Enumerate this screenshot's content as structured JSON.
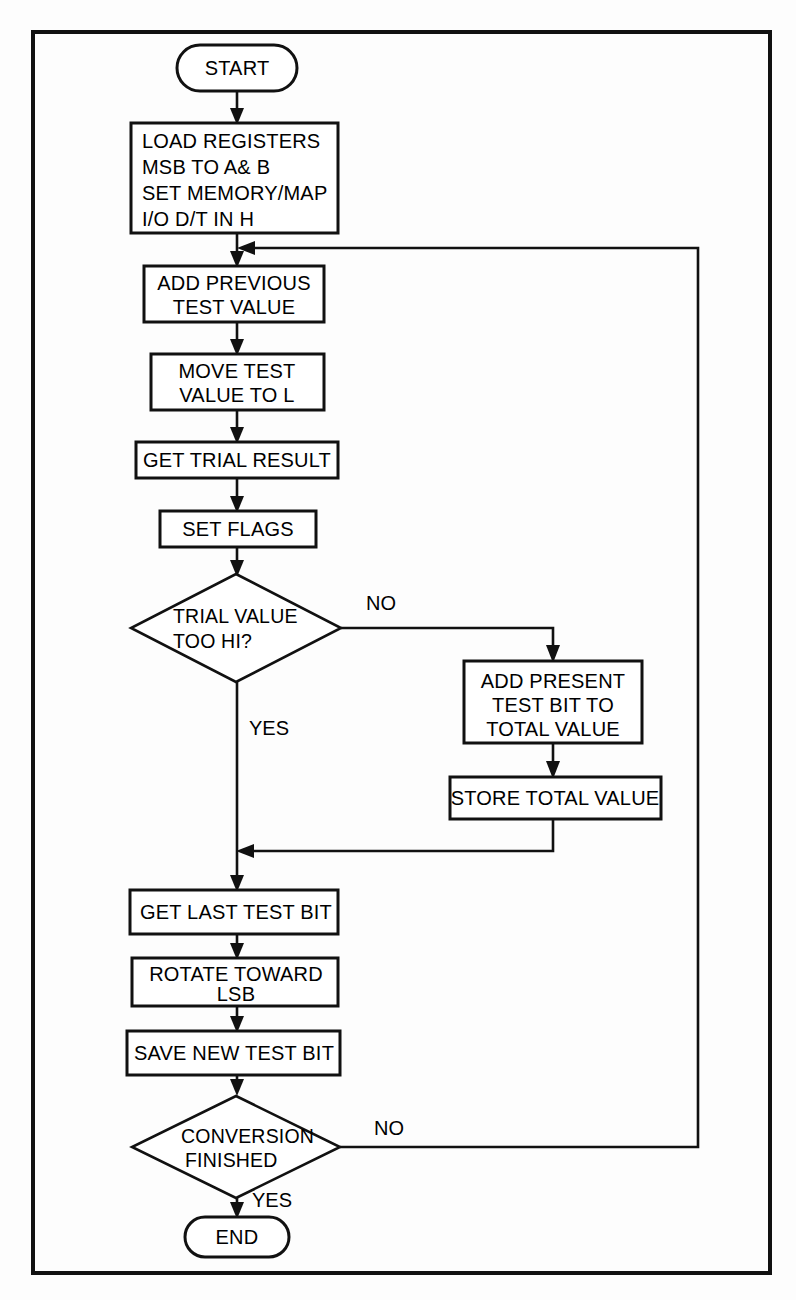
{
  "diagram": {
    "stroke_color": "#111111",
    "fill_color": "#ffffff",
    "background_color": "#fdfdfd",
    "frame": {
      "x": 33,
      "y": 32,
      "width": 737,
      "height": 1241
    },
    "nodes": [
      {
        "id": "start",
        "type": "terminator",
        "lines": [
          "START"
        ],
        "cx": 237,
        "cy": 68,
        "width": 120,
        "height": 46
      },
      {
        "id": "load_registers",
        "type": "process",
        "lines": [
          "LOAD REGISTERS",
          "MSB TO A& B",
          "SET MEMORY/MAP",
          "I/O D/T IN H"
        ],
        "x": 131,
        "y": 123,
        "width": 207,
        "height": 110
      },
      {
        "id": "add_previous",
        "type": "process",
        "lines": [
          "ADD PREVIOUS",
          "TEST VALUE"
        ],
        "x": 144,
        "y": 266,
        "width": 180,
        "height": 56
      },
      {
        "id": "move_test",
        "type": "process",
        "lines": [
          "MOVE TEST",
          "VALUE TO L"
        ],
        "x": 151,
        "y": 354,
        "width": 173,
        "height": 56
      },
      {
        "id": "get_trial_result",
        "type": "process",
        "lines": [
          "GET TRIAL RESULT"
        ],
        "x": 136,
        "y": 442,
        "width": 202,
        "height": 36
      },
      {
        "id": "set_flags",
        "type": "process",
        "lines": [
          "SET FLAGS"
        ],
        "x": 160,
        "y": 511,
        "width": 156,
        "height": 36
      },
      {
        "id": "trial_too_hi",
        "type": "decision",
        "lines": [
          "TRIAL VALUE",
          "TOO HI?"
        ],
        "cx": 236,
        "cy": 628,
        "halfw": 105,
        "halfh": 54
      },
      {
        "id": "add_present",
        "type": "process",
        "lines": [
          "ADD PRESENT",
          "TEST BIT TO",
          "TOTAL VALUE"
        ],
        "x": 464,
        "y": 661,
        "width": 178,
        "height": 82
      },
      {
        "id": "store_total",
        "type": "process",
        "lines": [
          "STORE TOTAL VALUE"
        ],
        "x": 450,
        "y": 777,
        "width": 211,
        "height": 42
      },
      {
        "id": "get_last_test_bit",
        "type": "process",
        "lines": [
          "GET LAST TEST BIT"
        ],
        "x": 130,
        "y": 890,
        "width": 208,
        "height": 44
      },
      {
        "id": "rotate_toward_lsb",
        "type": "process",
        "lines": [
          "ROTATE TOWARD",
          "LSB"
        ],
        "x": 132,
        "y": 958,
        "width": 206,
        "height": 48
      },
      {
        "id": "save_new_test_bit",
        "type": "process",
        "lines": [
          "SAVE NEW TEST BIT"
        ],
        "x": 127,
        "y": 1031,
        "width": 213,
        "height": 44
      },
      {
        "id": "conversion_finished",
        "type": "decision",
        "lines": [
          "CONVERSION",
          "FINISHED"
        ],
        "cx": 236,
        "cy": 1147,
        "halfw": 104,
        "halfh": 51
      },
      {
        "id": "end",
        "type": "terminator",
        "lines": [
          "END"
        ],
        "cx": 237,
        "cy": 1237,
        "width": 104,
        "height": 40
      }
    ],
    "edge_labels": [
      {
        "id": "no_trial",
        "text": "NO",
        "x": 366,
        "y": 610
      },
      {
        "id": "yes_trial",
        "text": "YES",
        "x": 249,
        "y": 735
      },
      {
        "id": "no_conversion",
        "text": "NO",
        "x": 374,
        "y": 1135
      },
      {
        "id": "yes_conversion",
        "text": "YES",
        "x": 252,
        "y": 1207
      }
    ],
    "connections": [
      {
        "id": "start-to-load",
        "from": "start",
        "to": "load_registers"
      },
      {
        "id": "load-to-add-previous",
        "from": "load_registers",
        "to": "add_previous"
      },
      {
        "id": "add-previous-to-move",
        "from": "add_previous",
        "to": "move_test"
      },
      {
        "id": "move-to-get-trial",
        "from": "move_test",
        "to": "get_trial_result"
      },
      {
        "id": "get-trial-to-set-flags",
        "from": "get_trial_result",
        "to": "set_flags"
      },
      {
        "id": "set-flags-to-decision",
        "from": "set_flags",
        "to": "trial_too_hi"
      },
      {
        "id": "trial-no-to-add-present",
        "from": "trial_too_hi",
        "to": "add_present",
        "label": "NO"
      },
      {
        "id": "add-present-to-store",
        "from": "add_present",
        "to": "store_total"
      },
      {
        "id": "trial-yes-down",
        "from": "trial_too_hi",
        "to": "get_last_test_bit",
        "label": "YES"
      },
      {
        "id": "store-to-merge",
        "from": "store_total",
        "to": "get_last_test_bit"
      },
      {
        "id": "get-last-to-rotate",
        "from": "get_last_test_bit",
        "to": "rotate_toward_lsb"
      },
      {
        "id": "rotate-to-save",
        "from": "rotate_toward_lsb",
        "to": "save_new_test_bit"
      },
      {
        "id": "save-to-decision",
        "from": "save_new_test_bit",
        "to": "conversion_finished"
      },
      {
        "id": "conversion-yes-to-end",
        "from": "conversion_finished",
        "to": "end",
        "label": "YES"
      },
      {
        "id": "conversion-no-feedback",
        "from": "conversion_finished",
        "to": "add_previous",
        "label": "NO"
      }
    ]
  }
}
